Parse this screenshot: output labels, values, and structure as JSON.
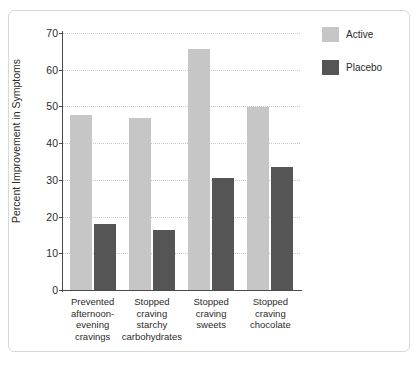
{
  "chart_data": {
    "type": "bar",
    "title": "",
    "xlabel": "",
    "ylabel": "Percent Improvement in Symptoms",
    "ylim": [
      0,
      70
    ],
    "yticks": [
      0,
      10,
      20,
      30,
      40,
      50,
      60,
      70
    ],
    "grid": true,
    "legend_position": "right",
    "categories": [
      "Prevented\nafternoon-\nevening\ncravings",
      "Stopped\ncraving\nstarchy\ncarbohydrates",
      "Stopped\ncraving\nsweets",
      "Stopped\ncraving\nchocolate"
    ],
    "series": [
      {
        "name": "Active",
        "color": "#c6c6c6",
        "values": [
          47.7,
          46.8,
          65.6,
          49.8
        ]
      },
      {
        "name": "Placebo",
        "color": "#555555",
        "values": [
          18.1,
          16.4,
          30.5,
          33.5
        ]
      }
    ]
  },
  "legend": {
    "items": [
      {
        "label": "Active"
      },
      {
        "label": "Placebo"
      }
    ]
  },
  "colors": {
    "active": "#c6c6c6",
    "placebo": "#555555",
    "axis": "#4a4a4a",
    "grid": "#c9c9c9",
    "frame": "#d8d8d8",
    "text": "#2b2b2b"
  }
}
